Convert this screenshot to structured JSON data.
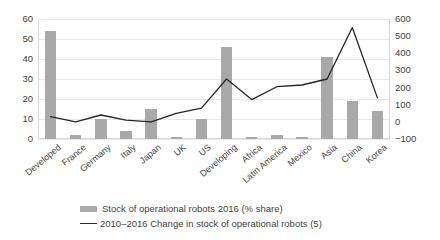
{
  "chart_data": {
    "type": "bar",
    "title": "",
    "subtitle": "",
    "xlabel": "",
    "ylabel": "",
    "categories": [
      "Developed",
      "France",
      "Germany",
      "Italy",
      "Japan",
      "UK",
      "US",
      "Developing",
      "Africa",
      "Latin America",
      "Mexico",
      "Asia",
      "China",
      "Korea"
    ],
    "grid": true,
    "legend_position": "bottom",
    "axes": {
      "left": {
        "label": "",
        "ylim": [
          0,
          60
        ],
        "ticks": [
          0,
          10,
          20,
          30,
          40,
          50,
          60
        ],
        "tick_labels": [
          "0",
          "10",
          "20",
          "30",
          "40",
          "50",
          "60"
        ]
      },
      "right": {
        "label": "",
        "ylim": [
          -100,
          600
        ],
        "ticks": [
          -100,
          0,
          100,
          200,
          300,
          400,
          500,
          600
        ],
        "tick_labels": [
          "−100",
          "0",
          "100",
          "200",
          "300",
          "400",
          "500",
          "600"
        ]
      }
    },
    "series": [
      {
        "name": "Stock of operational robots 2016 (% share)",
        "type": "bar",
        "axis": "left",
        "color": "#a9a9a9",
        "values": [
          54,
          2,
          10,
          4,
          15,
          1,
          10,
          46,
          1,
          2,
          1,
          41,
          19,
          14
        ]
      },
      {
        "name": "2010–2016 Change in stock of operational robots (5)",
        "type": "line",
        "axis": "right",
        "color": "#262626",
        "values": [
          30,
          0,
          40,
          10,
          0,
          50,
          80,
          250,
          130,
          205,
          215,
          250,
          550,
          140
        ]
      }
    ]
  },
  "legend": {
    "items": [
      {
        "label": "Stock of operational robots 2016 (% share)",
        "marker": "bar-swatch",
        "color": "#a9a9a9"
      },
      {
        "label": "2010–2016 Change in stock of operational robots (5)",
        "marker": "line-swatch",
        "color": "#262626"
      }
    ]
  }
}
